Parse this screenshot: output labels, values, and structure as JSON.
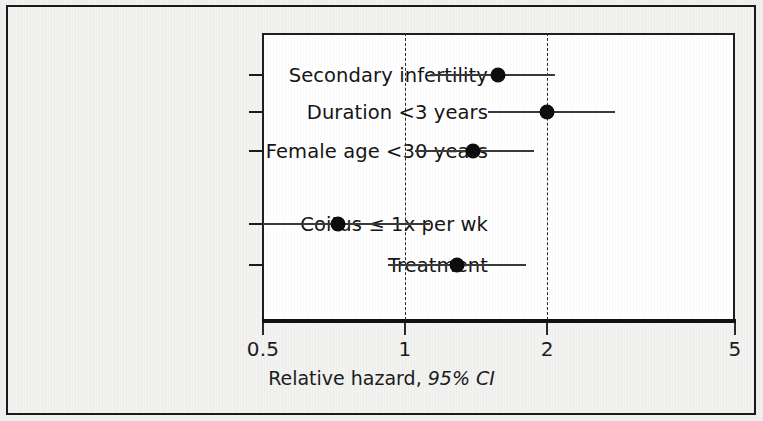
{
  "figure": {
    "background_color": "#f0f0ee",
    "border_color": "#1a1a1a",
    "plot_background": "#ffffff",
    "marker_color": "#0d0d0d",
    "line_color": "#3a3a3a"
  },
  "axis": {
    "title_main": "Relative hazard,",
    "title_italic": "95% CI",
    "ticks": [
      {
        "label": "0.5",
        "value": 0.5
      },
      {
        "label": "1",
        "value": 1
      },
      {
        "label": "2",
        "value": 2
      },
      {
        "label": "5",
        "value": 5
      }
    ],
    "gridlines": [
      1,
      2
    ]
  },
  "chart_data": {
    "type": "scatter",
    "subtype": "forest-plot",
    "title": "",
    "xlabel": "Relative hazard, 95% CI",
    "ylabel": "",
    "xscale": "log",
    "xlim": [
      0.5,
      5
    ],
    "xticks": [
      0.5,
      1,
      2,
      5
    ],
    "xticklabels": [
      "0.5",
      "1",
      "2",
      "5"
    ],
    "reference_lines": [
      1,
      2
    ],
    "grid": false,
    "legend": "none",
    "categories": [
      "Secondary infertility",
      "Duration <3 years",
      "Female age <30 years",
      "",
      "Coitus ≤ 1x per wk",
      "Treatment"
    ],
    "rows": [
      {
        "label": "Secondary infertility",
        "estimate": 1.57,
        "ci_low": 1.13,
        "ci_high": 2.08,
        "y": 75
      },
      {
        "label": "Duration <3 years",
        "estimate": 2.0,
        "ci_low": 1.5,
        "ci_high": 2.78,
        "y": 112
      },
      {
        "label": "Female age <30 years",
        "estimate": 1.39,
        "ci_low": 1.05,
        "ci_high": 1.88,
        "y": 151
      },
      {
        "label": "Coitus ≤ 1x per wk",
        "estimate": 0.72,
        "ci_low": 0.5,
        "ci_high": 1.13,
        "y": 224
      },
      {
        "label": "Treatment",
        "estimate": 1.29,
        "ci_low": 0.92,
        "ci_high": 1.8,
        "y": 265
      }
    ]
  }
}
